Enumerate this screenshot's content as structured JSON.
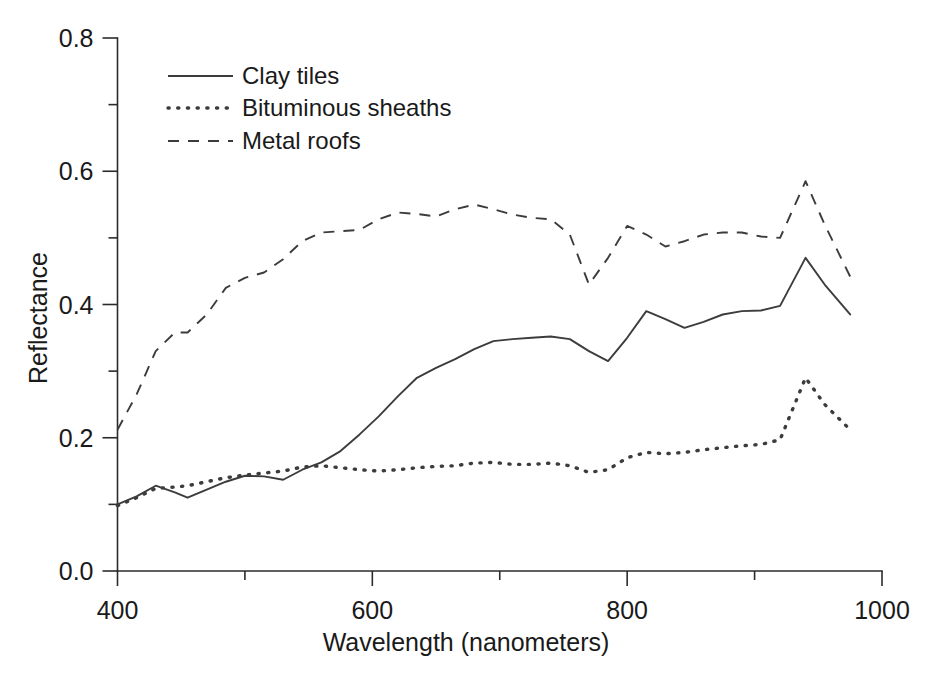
{
  "chart_data": {
    "type": "line",
    "title": "",
    "xlabel": "Wavelength (nanometers)",
    "ylabel": "Reflectance",
    "xlim": [
      400,
      1000
    ],
    "ylim": [
      0.0,
      0.8
    ],
    "xticks": [
      400,
      600,
      800,
      1000
    ],
    "xtick_labels": [
      "400",
      "600",
      "800",
      "1000"
    ],
    "xminorticks": [
      500,
      700,
      900
    ],
    "yticks": [
      0.0,
      0.2,
      0.4,
      0.6,
      0.8
    ],
    "ytick_labels": [
      "0.0",
      "0.2",
      "0.4",
      "0.6",
      "0.8"
    ],
    "yminorticks": [
      0.1,
      0.3,
      0.5,
      0.7
    ],
    "grid": false,
    "legend_position": "upper-left-inside",
    "x": [
      400,
      415,
      430,
      445,
      455,
      470,
      485,
      500,
      515,
      530,
      545,
      560,
      575,
      590,
      605,
      620,
      635,
      650,
      665,
      680,
      695,
      710,
      725,
      740,
      755,
      770,
      785,
      800,
      815,
      830,
      845,
      860,
      875,
      890,
      905,
      920,
      940,
      955,
      975
    ],
    "series": [
      {
        "name": "Clay tiles",
        "style": "solid",
        "values": [
          0.1,
          0.112,
          0.128,
          0.118,
          0.11,
          0.122,
          0.134,
          0.143,
          0.142,
          0.137,
          0.152,
          0.163,
          0.18,
          0.205,
          0.232,
          0.262,
          0.29,
          0.305,
          0.318,
          0.333,
          0.345,
          0.348,
          0.35,
          0.352,
          0.348,
          0.33,
          0.315,
          0.35,
          0.39,
          0.378,
          0.365,
          0.374,
          0.385,
          0.39,
          0.391,
          0.398,
          0.47,
          0.43,
          0.385
        ]
      },
      {
        "name": "Bituminous sheaths",
        "style": "dotted",
        "values": [
          0.098,
          0.11,
          0.124,
          0.126,
          0.128,
          0.134,
          0.14,
          0.144,
          0.147,
          0.15,
          0.156,
          0.158,
          0.155,
          0.152,
          0.15,
          0.152,
          0.155,
          0.157,
          0.158,
          0.162,
          0.163,
          0.16,
          0.16,
          0.162,
          0.158,
          0.148,
          0.152,
          0.17,
          0.178,
          0.176,
          0.178,
          0.182,
          0.185,
          0.188,
          0.19,
          0.197,
          0.29,
          0.25,
          0.212
        ]
      },
      {
        "name": "Metal roofs",
        "style": "dashed",
        "values": [
          0.212,
          0.265,
          0.33,
          0.358,
          0.358,
          0.385,
          0.425,
          0.44,
          0.448,
          0.468,
          0.495,
          0.508,
          0.51,
          0.512,
          0.528,
          0.538,
          0.536,
          0.532,
          0.543,
          0.55,
          0.543,
          0.535,
          0.53,
          0.528,
          0.505,
          0.43,
          0.47,
          0.518,
          0.505,
          0.487,
          0.495,
          0.505,
          0.508,
          0.508,
          0.502,
          0.5,
          0.585,
          0.52,
          0.442
        ]
      }
    ]
  },
  "legend": {
    "items": [
      {
        "label": "Clay tiles",
        "style": "solid"
      },
      {
        "label": "Bituminous sheaths",
        "style": "dotted"
      },
      {
        "label": "Metal roofs",
        "style": "dashed"
      }
    ]
  },
  "axes": {
    "x_title": "Wavelength (nanometers)",
    "y_title": "Reflectance"
  },
  "colors": {
    "line": "#3c3c3c",
    "axis": "#2b2b2b",
    "text": "#1a1a1a",
    "background": "#ffffff"
  }
}
